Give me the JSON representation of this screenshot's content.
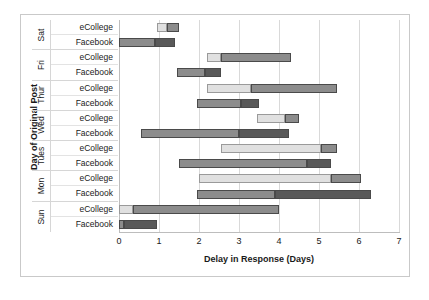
{
  "chart_data": {
    "type": "bar",
    "subtype": "stacked-horizontal-range",
    "title": "",
    "xlabel": "Delay in Response (Days)",
    "ylabel": "Day of Original Post",
    "xlim": [
      0,
      7
    ],
    "xticks": [
      0,
      1,
      2,
      3,
      4,
      5,
      6,
      7
    ],
    "grid": true,
    "legend": "none",
    "categories": [
      "Sat",
      "Fri",
      "Thur",
      "Wed",
      "Tues",
      "Mon",
      "Sun"
    ],
    "series_labels": [
      "eCollege",
      "Facebook"
    ],
    "colors": {
      "light": "#e0e0e0",
      "medium": "#8c8c8c",
      "dark": "#595959",
      "grid": "#d9d9d9",
      "border": "#c9c9c9",
      "text": "#1a1a1a"
    },
    "rows": [
      {
        "day": "Sat",
        "platform": "eCollege",
        "start": 0.95,
        "end": 1.5,
        "segments": [
          {
            "from": 0.95,
            "to": 1.2,
            "shade": "light"
          },
          {
            "from": 1.2,
            "to": 1.5,
            "shade": "medium"
          }
        ]
      },
      {
        "day": "Sat",
        "platform": "Facebook",
        "start": 0.0,
        "end": 1.4,
        "segments": [
          {
            "from": 0.0,
            "to": 0.9,
            "shade": "medium"
          },
          {
            "from": 0.9,
            "to": 1.4,
            "shade": "dark"
          }
        ]
      },
      {
        "day": "Fri",
        "platform": "eCollege",
        "start": 2.2,
        "end": 4.3,
        "segments": [
          {
            "from": 2.2,
            "to": 2.55,
            "shade": "light"
          },
          {
            "from": 2.55,
            "to": 4.3,
            "shade": "medium"
          }
        ]
      },
      {
        "day": "Fri",
        "platform": "Facebook",
        "start": 1.45,
        "end": 2.55,
        "segments": [
          {
            "from": 1.45,
            "to": 2.15,
            "shade": "medium"
          },
          {
            "from": 2.15,
            "to": 2.55,
            "shade": "dark"
          }
        ]
      },
      {
        "day": "Thur",
        "platform": "eCollege",
        "start": 2.2,
        "end": 5.45,
        "segments": [
          {
            "from": 2.2,
            "to": 3.3,
            "shade": "light"
          },
          {
            "from": 3.3,
            "to": 5.45,
            "shade": "medium"
          }
        ]
      },
      {
        "day": "Thur",
        "platform": "Facebook",
        "start": 1.95,
        "end": 3.5,
        "segments": [
          {
            "from": 1.95,
            "to": 3.05,
            "shade": "medium"
          },
          {
            "from": 3.05,
            "to": 3.5,
            "shade": "dark"
          }
        ]
      },
      {
        "day": "Wed",
        "platform": "eCollege",
        "start": 3.45,
        "end": 4.5,
        "segments": [
          {
            "from": 3.45,
            "to": 4.15,
            "shade": "light"
          },
          {
            "from": 4.15,
            "to": 4.5,
            "shade": "medium"
          }
        ]
      },
      {
        "day": "Wed",
        "platform": "Facebook",
        "start": 0.55,
        "end": 4.25,
        "segments": [
          {
            "from": 0.55,
            "to": 3.0,
            "shade": "medium"
          },
          {
            "from": 3.0,
            "to": 4.25,
            "shade": "dark"
          }
        ]
      },
      {
        "day": "Tues",
        "platform": "eCollege",
        "start": 2.55,
        "end": 5.45,
        "segments": [
          {
            "from": 2.55,
            "to": 5.05,
            "shade": "light"
          },
          {
            "from": 5.05,
            "to": 5.45,
            "shade": "medium"
          }
        ]
      },
      {
        "day": "Tues",
        "platform": "Facebook",
        "start": 1.5,
        "end": 5.3,
        "segments": [
          {
            "from": 1.5,
            "to": 4.7,
            "shade": "medium"
          },
          {
            "from": 4.7,
            "to": 5.3,
            "shade": "dark"
          }
        ]
      },
      {
        "day": "Mon",
        "platform": "eCollege",
        "start": 2.0,
        "end": 6.05,
        "segments": [
          {
            "from": 2.0,
            "to": 5.3,
            "shade": "light"
          },
          {
            "from": 5.3,
            "to": 6.05,
            "shade": "medium"
          }
        ]
      },
      {
        "day": "Mon",
        "platform": "Facebook",
        "start": 1.95,
        "end": 6.3,
        "segments": [
          {
            "from": 1.95,
            "to": 3.9,
            "shade": "medium"
          },
          {
            "from": 3.9,
            "to": 6.3,
            "shade": "dark"
          }
        ]
      },
      {
        "day": "Sun",
        "platform": "eCollege",
        "start": 0.0,
        "end": 4.0,
        "segments": [
          {
            "from": 0.0,
            "to": 0.35,
            "shade": "light"
          },
          {
            "from": 0.35,
            "to": 4.0,
            "shade": "medium"
          }
        ]
      },
      {
        "day": "Sun",
        "platform": "Facebook",
        "start": 0.0,
        "end": 0.95,
        "segments": [
          {
            "from": 0.0,
            "to": 0.12,
            "shade": "medium"
          },
          {
            "from": 0.12,
            "to": 0.95,
            "shade": "dark"
          }
        ]
      }
    ]
  },
  "axis": {
    "x_title": "Delay in Response (Days)",
    "y_title": "Day of Original Post",
    "x_tick_labels": [
      "0",
      "1",
      "2",
      "3",
      "4",
      "5",
      "6",
      "7"
    ]
  },
  "day_labels": [
    "Sat",
    "Fri",
    "Thur",
    "Wed",
    "Tues",
    "Mon",
    "Sun"
  ],
  "platform_labels": [
    "eCollege",
    "Facebook",
    "eCollege",
    "Facebook",
    "eCollege",
    "Facebook",
    "eCollege",
    "Facebook",
    "eCollege",
    "Facebook",
    "eCollege",
    "Facebook",
    "eCollege",
    "Facebook"
  ]
}
